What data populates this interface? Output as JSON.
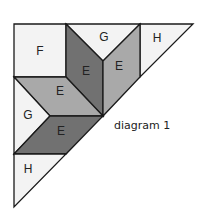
{
  "caption": "diagram 1",
  "colors": {
    "light": "#f3f3f3",
    "mid": "#a9a9a9",
    "dark": "#717171",
    "stroke": "#1a1a1a"
  },
  "pieces": [
    {
      "id": "F",
      "label": "F",
      "shade": "light"
    },
    {
      "id": "G-top",
      "label": "G",
      "shade": "light"
    },
    {
      "id": "H-top",
      "label": "H",
      "shade": "light"
    },
    {
      "id": "E-dark-upper",
      "label": "E",
      "shade": "dark"
    },
    {
      "id": "E-mid-right",
      "label": "E",
      "shade": "mid"
    },
    {
      "id": "E-mid-left",
      "label": "E",
      "shade": "mid"
    },
    {
      "id": "G-left",
      "label": "G",
      "shade": "light"
    },
    {
      "id": "E-dark-lower",
      "label": "E",
      "shade": "dark"
    },
    {
      "id": "H-bottom",
      "label": "H",
      "shade": "light"
    }
  ]
}
